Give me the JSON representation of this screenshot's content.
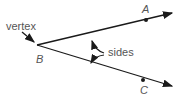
{
  "diagram": {
    "labels": {
      "vertex": "vertex",
      "sides": "sides",
      "point_a": "A",
      "point_b": "B",
      "point_c": "C"
    },
    "colors": {
      "line": "#1a1a1a",
      "text": "#555555"
    }
  }
}
